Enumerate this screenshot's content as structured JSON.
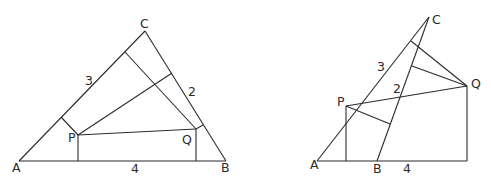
{
  "figures": [
    {
      "id": "left",
      "description": "Triangle ABC with interior point P and Q, perpendiculars to sides",
      "labels": {
        "A": "A",
        "B": "B",
        "C": "C",
        "P": "P",
        "Q": "Q",
        "side_AC": "3",
        "side_BC": "2",
        "side_AB": "4"
      }
    },
    {
      "id": "right",
      "description": "Triangle ABC with exterior points P and Q, perpendiculars to sides",
      "labels": {
        "A": "A",
        "B": "B",
        "C": "C",
        "P": "P",
        "Q": "Q",
        "side_AC": "3",
        "side_BC": "2",
        "side_AB": "4"
      }
    }
  ]
}
